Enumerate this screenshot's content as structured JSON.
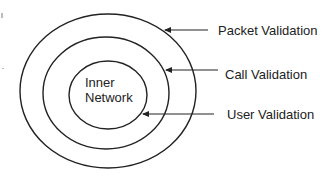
{
  "diagram": {
    "type": "concentric-layers",
    "center": {
      "line1": "Inner",
      "line2": "Network"
    },
    "layers": [
      {
        "id": "outer",
        "label": "Packet Validation"
      },
      {
        "id": "middle",
        "label": "Call Validation"
      },
      {
        "id": "inner",
        "label": "User Validation"
      }
    ],
    "colors": {
      "stroke": "#222222",
      "background": "#ffffff",
      "text": "#222222"
    }
  }
}
